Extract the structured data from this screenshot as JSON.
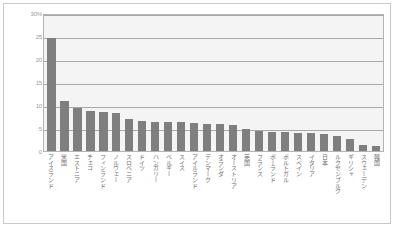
{
  "chart_data": {
    "type": "bar",
    "title": "",
    "xlabel": "",
    "ylabel": "",
    "ylim": [
      0,
      30
    ],
    "grid": true,
    "legend": "none",
    "y_ticks": [
      "0",
      "5",
      "10",
      "15",
      "20",
      "25",
      "30%"
    ],
    "y_tick_values": [
      0,
      5,
      10,
      15,
      20,
      25,
      30
    ],
    "categories": [
      "アイスランド",
      "米国",
      "エストニア",
      "チェコ",
      "フィンランド",
      "ノルウェー",
      "スロベニア",
      "ドイツ",
      "ハンガリー",
      "ベルギー",
      "スイス",
      "アイルランド",
      "デンマーク",
      "オランダ",
      "オーストリア",
      "英国",
      "フランス",
      "ポーランド",
      "ポルトガル",
      "スペイン",
      "イタリア",
      "日本",
      "ルクセンブルク",
      "ギリシャ",
      "スウェーデン",
      "韓国"
    ],
    "values": [
      24.6,
      10.9,
      9.3,
      8.7,
      8.5,
      8.2,
      7.0,
      6.6,
      6.4,
      6.3,
      6.2,
      6.0,
      5.9,
      5.8,
      5.6,
      4.7,
      4.4,
      4.2,
      4.1,
      4.0,
      3.9,
      3.7,
      3.2,
      2.6,
      1.4,
      1.0
    ],
    "colors": {
      "bar": "#7f7f7f",
      "plot_background": "#f4f4f4",
      "gridline": "#a9a9a9",
      "axis_text": "#9a9a9a",
      "category_text": "#6e6e6e",
      "figure_background": "#ffffff",
      "figure_border": "#c8c8c8"
    }
  }
}
